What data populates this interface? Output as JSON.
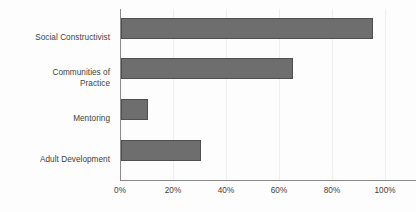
{
  "chart_data": {
    "type": "bar",
    "orientation": "horizontal",
    "title": "",
    "subtitle": "",
    "xlabel": "",
    "ylabel": "",
    "categories": [
      "Social Constructivist",
      "Communities of\nPractice",
      "Mentoring",
      "Adult Development"
    ],
    "category_labels": [
      {
        "line1": "Social Constructivist",
        "line2": ""
      },
      {
        "line1": "Communities of",
        "line2": "Practice"
      },
      {
        "line1": "Mentoring",
        "line2": ""
      },
      {
        "line1": "Adult Development",
        "line2": ""
      }
    ],
    "values": [
      95,
      65,
      10,
      30
    ],
    "value_unit": "%",
    "xlim": [
      0,
      100
    ],
    "xticks": [
      0,
      20,
      40,
      60,
      80,
      100
    ],
    "xtick_labels": [
      "0%",
      "20%",
      "40%",
      "60%",
      "80%",
      "100%"
    ],
    "xtick_label_clipped": {
      "index": 5,
      "visible_text": "10"
    },
    "grid": true,
    "grid_axis": "x",
    "legend": null,
    "legend_position": "none",
    "series": [
      {
        "name": "",
        "values": [
          95,
          65,
          10,
          30
        ]
      }
    ],
    "colors": {
      "bar_fill": "#6e6e6e",
      "bar_border": "#4f4f4f",
      "axis_line": "#8a8a8a",
      "gridline": "#eeeeee",
      "text": "#404040",
      "background": "#fdfdfd"
    }
  }
}
